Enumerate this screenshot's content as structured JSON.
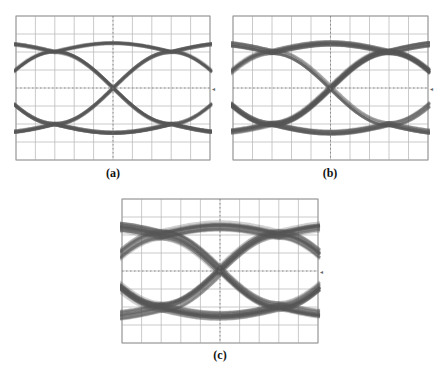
{
  "figure": {
    "panels": [
      {
        "id": "a",
        "label": "(a)",
        "x": 16,
        "y": 16,
        "w": 194,
        "h": 144,
        "label_x": 93,
        "label_y": 166,
        "jitter": 0.35,
        "noise": 0.55,
        "variant": "clean"
      },
      {
        "id": "b",
        "label": "(b)",
        "x": 233,
        "y": 16,
        "w": 195,
        "h": 144,
        "label_x": 310,
        "label_y": 166,
        "jitter": 0.55,
        "noise": 0.85,
        "variant": "wide"
      },
      {
        "id": "c",
        "label": "(c)",
        "x": 122,
        "y": 199,
        "w": 196,
        "h": 144,
        "label_x": 200,
        "label_y": 348,
        "jitter": 0.6,
        "noise": 1.0,
        "variant": "multilevel"
      }
    ]
  },
  "chart_data": [
    {
      "type": "eye-diagram",
      "title": "(a)",
      "grid": {
        "divisions_x": 10,
        "divisions_y": 8,
        "on": true,
        "center_lines_dotted": true
      },
      "unit_intervals_shown": 1.6,
      "eye_crossings_x_div": [
        2.0,
        8.0
      ],
      "levels_y_div": [
        2.0,
        6.0
      ],
      "eye_opening": "wide, clean",
      "trace_color": "#555555"
    },
    {
      "type": "eye-diagram",
      "title": "(b)",
      "grid": {
        "divisions_x": 10,
        "divisions_y": 8,
        "on": true,
        "center_lines_dotted": true
      },
      "unit_intervals_shown": 1.6,
      "eye_crossings_x_div": [
        2.0,
        8.0
      ],
      "levels_y_div": [
        2.0,
        6.0
      ],
      "eye_opening": "open, thicker traces (more noise/jitter)",
      "trace_color": "#555555"
    },
    {
      "type": "eye-diagram",
      "title": "(c)",
      "grid": {
        "divisions_x": 10,
        "divisions_y": 8,
        "on": true,
        "center_lines_dotted": true
      },
      "unit_intervals_shown": 1.6,
      "eye_crossings_x_div": [
        2.3,
        8.0
      ],
      "levels_y_div": [
        2.0,
        6.0
      ],
      "eye_opening": "reduced, multiple trace bundles visible",
      "trace_color": "#555555"
    }
  ]
}
